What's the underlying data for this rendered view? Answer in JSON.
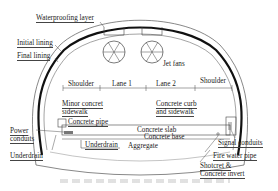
{
  "diagram": {
    "type": "tunnel cross-section",
    "labels": {
      "waterproofing": "Waterproofing layer",
      "initial_lining": "Initial lining",
      "final_lining": "Final lining",
      "jet_fans": "Jet fans",
      "shoulder_left": "Shoulder",
      "lane1": "Lane 1",
      "lane2": "Lane 2",
      "shoulder_right": "Shoulder",
      "minor_sidewalk": "Minor concret\nsidewalk",
      "minor_sidewalk_l1": "Minor concret",
      "minor_sidewalk_l2": "sidewalk",
      "concrete_pipe": "Concrete pipe",
      "curb_l1": "Concrete curb",
      "curb_l2": "and sidewalk",
      "power_l1": "Power",
      "power_l2": "conduits",
      "concrete_slab": "Concrete slab",
      "concrete_base": "Concrete base",
      "signal_conduits": "Signal conduits",
      "underdrain_left": "Underdrain",
      "underdrain_mid": "Underdrain",
      "aggregate": "Aggregate",
      "fire_water": "Fire water pipe",
      "shotcrete_l1": "Shotcret &",
      "shotcrete_l2": "Concrete invert"
    },
    "colors": {
      "line": "#333333",
      "thick_lining": "#111111",
      "text": "#222222"
    }
  }
}
